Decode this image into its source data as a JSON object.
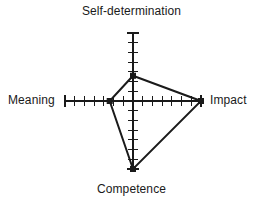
{
  "figure": {
    "width": 263,
    "height": 207,
    "background": "#ffffff",
    "ink_color": "#1a1a1a"
  },
  "labels": {
    "top": "Self-determination",
    "left": "Meaning",
    "right": "Impact",
    "bottom": "Competence"
  },
  "footnote": {
    "text": ""
  },
  "chart_data": {
    "type": "radar",
    "title": "",
    "subtitle": "",
    "xlabel": "",
    "ylabel": "",
    "grid": false,
    "legend": null,
    "legend_position": "none",
    "axes_count": 4,
    "axis_order": [
      "Self-determination",
      "Impact",
      "Competence",
      "Meaning"
    ],
    "axis_angles_deg": [
      90,
      0,
      270,
      180
    ],
    "categories": [
      "Self-determination",
      "Impact",
      "Competence",
      "Meaning"
    ],
    "values": [
      2.6,
      7.0,
      7.0,
      2.4
    ],
    "rlim": [
      0,
      7
    ],
    "tick_count_per_axis": 7,
    "tick_interval": 1,
    "series": [
      {
        "name": "Empowerment profile",
        "values": [
          2.6,
          7.0,
          7.0,
          2.4
        ],
        "line_color": "#1a1a1a",
        "line_width": 2,
        "marker": "square",
        "marker_size": 5,
        "fill": "none",
        "closed": true
      }
    ],
    "annotations": [],
    "geometry": {
      "center_x": 133,
      "center_y": 101,
      "axis_length_px": 68,
      "tick_half_len_px": 5
    }
  }
}
